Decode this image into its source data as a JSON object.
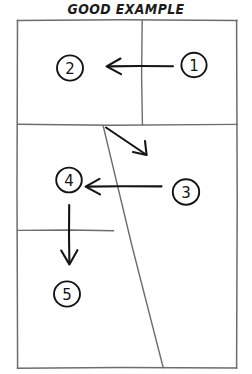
{
  "title": "GOOD EXAMPLE",
  "colors": {
    "ink": "#1b1b1b",
    "panel_border": "#6d6d6d",
    "arrow": "#141414",
    "background": "#ffffff"
  },
  "diagram": {
    "kind": "hand-drawn-panel-reading-order",
    "frame": {
      "left": 17,
      "top": 20,
      "right": 237,
      "bottom": 368
    },
    "panels": [
      {
        "marker": "1",
        "label": "1",
        "cx": 194,
        "cy": 65,
        "row": "top",
        "side": "right"
      },
      {
        "marker": "2",
        "label": "2",
        "cx": 70,
        "cy": 68,
        "row": "top",
        "side": "left"
      },
      {
        "marker": "3",
        "label": "3",
        "cx": 186,
        "cy": 192,
        "row": "middle",
        "side": "right"
      },
      {
        "marker": "4",
        "label": "4",
        "cx": 69,
        "cy": 180,
        "row": "middle",
        "side": "left"
      },
      {
        "marker": "5",
        "label": "5",
        "cx": 67,
        "cy": 294,
        "row": "bottom",
        "side": "left"
      }
    ],
    "dividers": [
      {
        "name": "top-row-vertical",
        "x1": 142,
        "y1": 20,
        "x2": 142,
        "y2": 124
      },
      {
        "name": "first-horizontal",
        "x1": 17,
        "y1": 124,
        "x2": 237,
        "y2": 125
      },
      {
        "name": "second-horizontal",
        "x1": 17,
        "y1": 230,
        "x2": 113,
        "y2": 231
      },
      {
        "name": "slanted-diagonal",
        "x1": 103,
        "y1": 126,
        "x2": 163,
        "y2": 368
      }
    ],
    "arrows": [
      {
        "name": "one-to-two",
        "from": "1",
        "to": "2",
        "direction": "left",
        "x1": 173,
        "y1": 66,
        "x2": 107,
        "y2": 66
      },
      {
        "name": "two-to-three",
        "from": "2",
        "to": "3",
        "direction": "down-right",
        "x1": 106,
        "y1": 127,
        "x2": 146,
        "y2": 154
      },
      {
        "name": "three-to-four",
        "from": "3",
        "to": "4",
        "direction": "left",
        "x1": 161,
        "y1": 186,
        "x2": 86,
        "y2": 186
      },
      {
        "name": "four-to-five",
        "from": "4",
        "to": "5",
        "direction": "down",
        "x1": 69,
        "y1": 205,
        "x2": 69,
        "y2": 262
      }
    ]
  }
}
